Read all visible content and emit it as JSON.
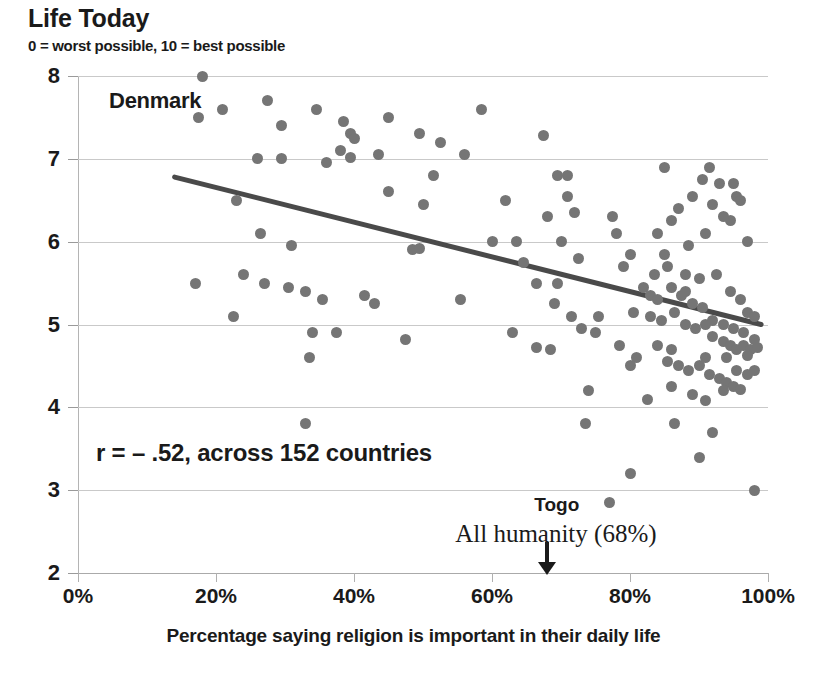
{
  "chart_data": {
    "type": "scatter",
    "title": "Life Today",
    "subtitle": "0 = worst possible, 10 = best possible",
    "xlabel": "Percentage saying religion is important in their daily life",
    "ylabel": "",
    "xlim": [
      0,
      100
    ],
    "ylim": [
      2,
      8
    ],
    "xticks": [
      0,
      20,
      40,
      60,
      80,
      100
    ],
    "xticklabels": [
      "0%",
      "20%",
      "40%",
      "60%",
      "80%",
      "100%"
    ],
    "yticks": [
      2,
      3,
      4,
      5,
      6,
      7,
      8
    ],
    "yticklabels": [
      "2",
      "3",
      "4",
      "5",
      "6",
      "7",
      "8"
    ],
    "grid": true,
    "legend": "none",
    "correlation": "r = – .52, across 152 countries",
    "annotations": [
      {
        "name": "denmark",
        "text": "Denmark",
        "x": 20,
        "y": 7.8
      },
      {
        "name": "togo",
        "text": "Togo",
        "x": 77,
        "y": 2.85
      },
      {
        "name": "all-humanity",
        "text": "All humanity (68%)",
        "x": 68,
        "y": 2.55
      }
    ],
    "marker_color": "#757575",
    "trendline": {
      "color": "#4a4a4a",
      "x0": 14,
      "y0": 6.78,
      "x1": 99,
      "y1": 5.0
    },
    "points": [
      [
        18.0,
        8.0
      ],
      [
        17.5,
        7.5
      ],
      [
        21.0,
        7.6
      ],
      [
        27.5,
        7.7
      ],
      [
        29.5,
        7.4
      ],
      [
        34.5,
        7.6
      ],
      [
        38.5,
        7.45
      ],
      [
        39.5,
        7.3
      ],
      [
        45.0,
        7.5
      ],
      [
        49.5,
        7.3
      ],
      [
        52.5,
        7.2
      ],
      [
        58.5,
        7.6
      ],
      [
        67.5,
        7.28
      ],
      [
        26.0,
        7.0
      ],
      [
        29.5,
        7.0
      ],
      [
        38.0,
        7.1
      ],
      [
        39.5,
        7.02
      ],
      [
        51.5,
        6.8
      ],
      [
        69.5,
        6.8
      ],
      [
        71.0,
        6.8
      ],
      [
        85.0,
        6.9
      ],
      [
        91.5,
        6.9
      ],
      [
        93.0,
        6.7
      ],
      [
        95.5,
        6.55
      ],
      [
        23.0,
        6.5
      ],
      [
        26.5,
        6.1
      ],
      [
        45.0,
        6.6
      ],
      [
        50.0,
        6.45
      ],
      [
        62.0,
        6.5
      ],
      [
        68.0,
        6.3
      ],
      [
        77.5,
        6.3
      ],
      [
        86.0,
        6.25
      ],
      [
        92.0,
        6.45
      ],
      [
        94.5,
        6.25
      ],
      [
        97.0,
        6.0
      ],
      [
        31.0,
        5.95
      ],
      [
        48.5,
        5.9
      ],
      [
        49.5,
        5.92
      ],
      [
        63.5,
        6.0
      ],
      [
        70.0,
        6.0
      ],
      [
        84.0,
        6.1
      ],
      [
        88.5,
        5.95
      ],
      [
        91.0,
        6.1
      ],
      [
        24.0,
        5.6
      ],
      [
        27.0,
        5.5
      ],
      [
        30.5,
        5.45
      ],
      [
        33.0,
        5.4
      ],
      [
        35.5,
        5.3
      ],
      [
        41.5,
        5.35
      ],
      [
        43.0,
        5.25
      ],
      [
        55.5,
        5.3
      ],
      [
        66.5,
        5.5
      ],
      [
        69.5,
        5.5
      ],
      [
        72.5,
        5.8
      ],
      [
        79.0,
        5.7
      ],
      [
        83.5,
        5.6
      ],
      [
        85.5,
        5.7
      ],
      [
        88.0,
        5.6
      ],
      [
        90.0,
        5.55
      ],
      [
        92.5,
        5.6
      ],
      [
        94.5,
        5.4
      ],
      [
        97.0,
        5.15
      ],
      [
        98.0,
        5.1
      ],
      [
        17.0,
        5.5
      ],
      [
        22.5,
        5.1
      ],
      [
        34.0,
        4.9
      ],
      [
        37.5,
        4.9
      ],
      [
        47.5,
        4.82
      ],
      [
        63.0,
        4.9
      ],
      [
        66.5,
        4.72
      ],
      [
        68.5,
        4.7
      ],
      [
        75.5,
        5.1
      ],
      [
        80.5,
        5.15
      ],
      [
        83.0,
        5.1
      ],
      [
        84.5,
        5.05
      ],
      [
        86.5,
        5.15
      ],
      [
        88.0,
        5.0
      ],
      [
        89.5,
        4.95
      ],
      [
        91.0,
        5.0
      ],
      [
        92.0,
        4.85
      ],
      [
        93.5,
        4.8
      ],
      [
        94.5,
        4.75
      ],
      [
        95.5,
        4.7
      ],
      [
        96.5,
        4.75
      ],
      [
        97.5,
        4.7
      ],
      [
        98.5,
        4.72
      ],
      [
        33.5,
        4.6
      ],
      [
        78.5,
        4.75
      ],
      [
        81.0,
        4.6
      ],
      [
        85.5,
        4.55
      ],
      [
        87.0,
        4.5
      ],
      [
        88.5,
        4.45
      ],
      [
        90.0,
        4.5
      ],
      [
        91.5,
        4.4
      ],
      [
        93.0,
        4.35
      ],
      [
        94.0,
        4.3
      ],
      [
        95.0,
        4.25
      ],
      [
        96.0,
        4.22
      ],
      [
        97.0,
        4.4
      ],
      [
        98.0,
        4.45
      ],
      [
        74.0,
        4.2
      ],
      [
        82.5,
        4.1
      ],
      [
        86.0,
        4.25
      ],
      [
        89.0,
        4.15
      ],
      [
        91.0,
        4.08
      ],
      [
        93.5,
        4.2
      ],
      [
        86.5,
        3.8
      ],
      [
        92.0,
        3.7
      ],
      [
        73.5,
        3.8
      ],
      [
        33.0,
        3.8
      ],
      [
        80.0,
        3.2
      ],
      [
        90.0,
        3.4
      ],
      [
        98.0,
        3.0
      ],
      [
        77.0,
        2.85
      ],
      [
        69.0,
        5.25
      ],
      [
        71.5,
        5.1
      ],
      [
        73.0,
        4.95
      ],
      [
        75.0,
        4.9
      ],
      [
        82.0,
        5.45
      ],
      [
        83.0,
        5.35
      ],
      [
        84.0,
        5.3
      ],
      [
        86.0,
        5.45
      ],
      [
        87.5,
        5.35
      ],
      [
        89.0,
        5.25
      ],
      [
        90.5,
        5.2
      ],
      [
        92.0,
        5.05
      ],
      [
        93.5,
        5.0
      ],
      [
        95.0,
        4.95
      ],
      [
        96.5,
        4.9
      ],
      [
        98.0,
        4.82
      ],
      [
        60.0,
        6.0
      ],
      [
        64.5,
        5.75
      ],
      [
        71.0,
        6.55
      ],
      [
        72.0,
        6.35
      ],
      [
        78.0,
        6.1
      ],
      [
        80.0,
        5.85
      ],
      [
        87.0,
        6.4
      ],
      [
        89.0,
        6.55
      ],
      [
        90.5,
        6.75
      ],
      [
        93.5,
        6.3
      ],
      [
        95.0,
        6.7
      ],
      [
        96.0,
        6.5
      ],
      [
        40.0,
        7.25
      ],
      [
        43.5,
        7.05
      ],
      [
        36.0,
        6.95
      ],
      [
        56.0,
        7.05
      ],
      [
        85.0,
        5.85
      ],
      [
        88.0,
        5.4
      ],
      [
        91.0,
        4.6
      ],
      [
        96.0,
        5.3
      ],
      [
        86.0,
        4.7
      ],
      [
        84.0,
        4.75
      ],
      [
        80.0,
        4.5
      ],
      [
        94.0,
        4.6
      ],
      [
        95.5,
        4.45
      ],
      [
        97.0,
        4.62
      ]
    ]
  }
}
